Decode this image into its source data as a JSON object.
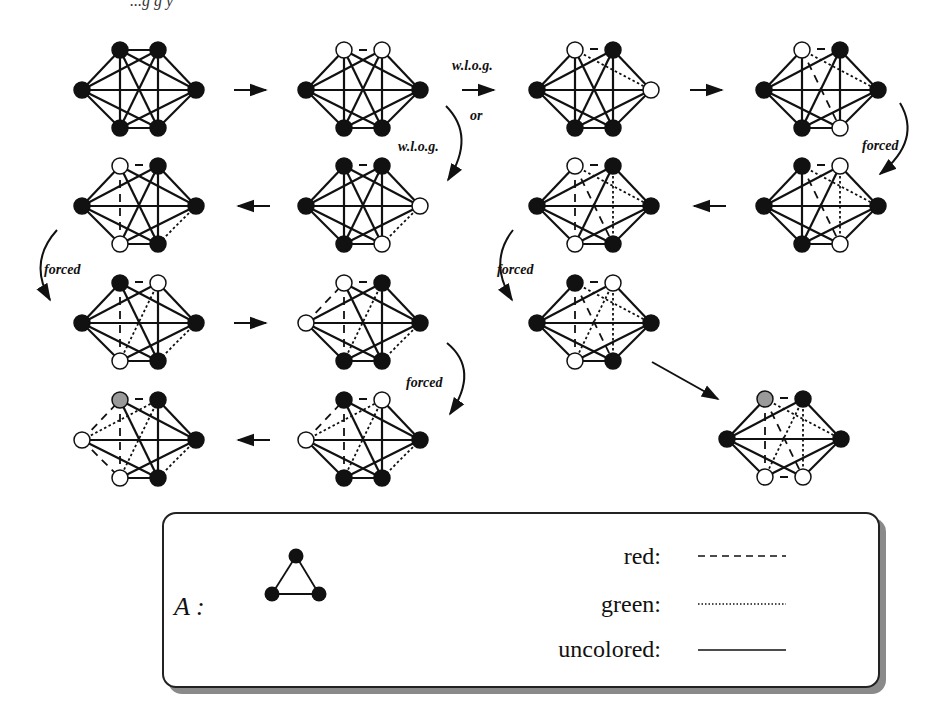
{
  "figure": {
    "top_fragment": "...g g y",
    "labels": {
      "wlog_1": "w.l.o.g.",
      "or": "or",
      "wlog_2": "w.l.o.g.",
      "forced_1": "forced",
      "forced_2": "forced",
      "forced_3": "forced",
      "forced_4": "forced"
    },
    "colors": {
      "node_black": "#111111",
      "node_white": "#ffffff",
      "node_gray": "#9a9a9a",
      "edge": "#111111"
    },
    "node_positions": [
      "L",
      "TL",
      "TR",
      "R",
      "BL",
      "BR"
    ],
    "graphs": [
      {
        "id": "g1",
        "cx": 139,
        "cy": 90,
        "nodes": {
          "L": "black",
          "TL": "black",
          "TR": "black",
          "R": "black",
          "BL": "black",
          "BR": "black"
        }
      },
      {
        "id": "g2",
        "cx": 363,
        "cy": 90,
        "nodes": {
          "L": "black",
          "TL": "white",
          "TR": "white",
          "R": "black",
          "BL": "black",
          "BR": "black"
        }
      },
      {
        "id": "g3",
        "cx": 594,
        "cy": 90,
        "nodes": {
          "L": "black",
          "TL": "white",
          "TR": "black",
          "R": "white",
          "BL": "black",
          "BR": "black"
        }
      },
      {
        "id": "g4",
        "cx": 821,
        "cy": 90,
        "nodes": {
          "L": "black",
          "TL": "white",
          "TR": "black",
          "R": "black",
          "BL": "black",
          "BR": "white"
        }
      },
      {
        "id": "g5",
        "cx": 139,
        "cy": 206,
        "nodes": {
          "L": "black",
          "TL": "white",
          "TR": "black",
          "R": "black",
          "BL": "white",
          "BR": "black"
        }
      },
      {
        "id": "g6",
        "cx": 363,
        "cy": 206,
        "nodes": {
          "L": "black",
          "TL": "black",
          "TR": "black",
          "R": "white",
          "BL": "black",
          "BR": "white"
        }
      },
      {
        "id": "g7",
        "cx": 594,
        "cy": 206,
        "nodes": {
          "L": "black",
          "TL": "white",
          "TR": "black",
          "R": "black",
          "BL": "white",
          "BR": "black"
        }
      },
      {
        "id": "g8",
        "cx": 821,
        "cy": 206,
        "nodes": {
          "L": "black",
          "TL": "black",
          "TR": "white",
          "R": "black",
          "BL": "black",
          "BR": "white"
        }
      },
      {
        "id": "g9",
        "cx": 139,
        "cy": 323,
        "nodes": {
          "L": "black",
          "TL": "black",
          "TR": "white",
          "R": "black",
          "BL": "white",
          "BR": "black"
        }
      },
      {
        "id": "g10",
        "cx": 363,
        "cy": 323,
        "nodes": {
          "L": "white",
          "TL": "white",
          "TR": "black",
          "R": "black",
          "BL": "black",
          "BR": "black"
        }
      },
      {
        "id": "g11",
        "cx": 594,
        "cy": 323,
        "nodes": {
          "L": "black",
          "TL": "black",
          "TR": "white",
          "R": "black",
          "BL": "white",
          "BR": "black"
        }
      },
      {
        "id": "g12",
        "cx": 139,
        "cy": 440,
        "nodes": {
          "L": "white",
          "TL": "gray",
          "TR": "black",
          "R": "black",
          "BL": "white",
          "BR": "black"
        }
      },
      {
        "id": "g13",
        "cx": 363,
        "cy": 440,
        "nodes": {
          "L": "white",
          "TL": "black",
          "TR": "white",
          "R": "black",
          "BL": "black",
          "BR": "black"
        }
      },
      {
        "id": "g14",
        "cx": 784,
        "cy": 439,
        "nodes": {
          "L": "black",
          "TL": "gray",
          "TR": "black",
          "R": "black",
          "BL": "white",
          "BR": "white"
        }
      }
    ]
  },
  "legend": {
    "graph_label": "A :",
    "items": [
      {
        "label": "red:",
        "style": "dashed"
      },
      {
        "label": "green:",
        "style": "dotted"
      },
      {
        "label": "uncolored:",
        "style": "solid"
      }
    ]
  }
}
